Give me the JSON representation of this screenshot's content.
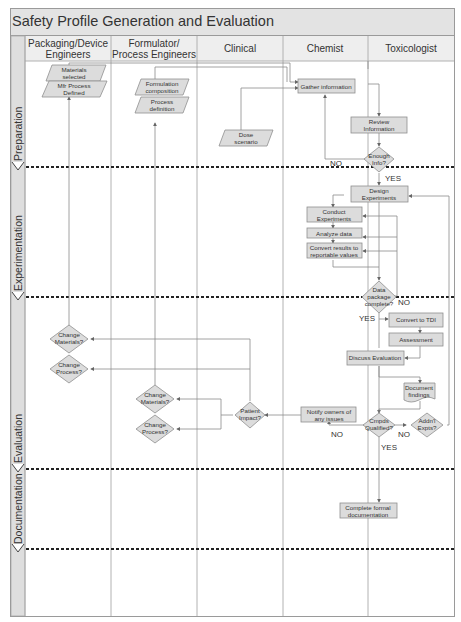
{
  "title": "Safety Profile Generation and Evaluation",
  "lanes": [
    {
      "line1": "Packaging/Device",
      "line2": "Engineers"
    },
    {
      "line1": "Formulator/",
      "line2": "Process Engineers"
    },
    {
      "line1": "Clinical",
      "line2": ""
    },
    {
      "line1": "Chemist",
      "line2": ""
    },
    {
      "line1": "Toxicologist",
      "line2": ""
    }
  ],
  "phases": [
    "Preparation",
    "Experimentation",
    "Evaluation",
    "Documentation"
  ],
  "shapes": {
    "materials_selected": [
      "Materials",
      "selected"
    ],
    "mfr_process": [
      "Mfr  Process",
      "Defined"
    ],
    "formulation_composition": [
      "Formulation",
      "composition"
    ],
    "process_definition": [
      "Process",
      "definition"
    ],
    "dose_scenario": [
      "Dose",
      "scenario"
    ],
    "gather_information": [
      "Gather information"
    ],
    "review_information": [
      "Review",
      "Information"
    ],
    "enough_info": [
      "Enough",
      "Info?"
    ],
    "design_experiments": [
      "Design",
      "Experiments"
    ],
    "conduct_experiments": [
      "Conduct",
      "Experiments"
    ],
    "analyze_data": [
      "Analyze data"
    ],
    "convert_results": [
      "Convert results to",
      "reportable values"
    ],
    "data_package_complete": [
      "Data",
      "package",
      "complete?"
    ],
    "convert_tdi": [
      "Convert to TDI"
    ],
    "assessment": [
      "Assessment"
    ],
    "discuss_evaluation": [
      "Discuss Evaluation"
    ],
    "document_findings": [
      "Document",
      "findings"
    ],
    "change_materials_pkg": [
      "Change",
      "Materials?"
    ],
    "change_process_pkg": [
      "Change",
      "Process?"
    ],
    "change_materials_form": [
      "Change",
      "Materials?"
    ],
    "change_process_form": [
      "Change",
      "Process?"
    ],
    "patient_impact": [
      "Patient",
      "Impact?"
    ],
    "notify_owners": [
      "Notify owners of",
      "any issues"
    ],
    "cmpds_qualified": [
      "Cmpds",
      "Qualified?"
    ],
    "addnl_expts": [
      "Addn'l",
      "Expts?"
    ],
    "complete_documentation": [
      "Complete formal",
      "documentation"
    ]
  },
  "labels": {
    "no_enough": "NO",
    "yes_enough": "YES",
    "no_package": "NO",
    "yes_package": "YES",
    "no_cmpds_left": "NO",
    "no_cmpds_right": "NO",
    "yes_cmpds": "YES"
  }
}
